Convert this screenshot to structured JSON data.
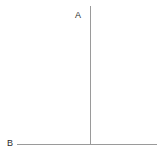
{
  "figure": {
    "title": "",
    "background_color": "#ffffff",
    "width": 164,
    "height": 158,
    "line_color": "#9a9a9a",
    "label_color": "#2b2b2b",
    "stroke_width": 1,
    "labels": {
      "vertical_label": "A",
      "horizontal_label": "B"
    },
    "segments": [
      {
        "name": "vertical-segment",
        "label": "A",
        "orientation": "vertical",
        "x1": 90.5,
        "y1": 6,
        "x2": 90.5,
        "y2": 144.5,
        "color": "#9a9a9a"
      },
      {
        "name": "horizontal-segment",
        "label": "B",
        "orientation": "horizontal",
        "x1": 17,
        "y1": 144.5,
        "x2": 157,
        "y2": 144.5,
        "color": "#9a9a9a"
      }
    ],
    "junction": {
      "name": "t-junction",
      "x": 90.5,
      "y": 144.5,
      "angle_degrees": 90
    }
  }
}
